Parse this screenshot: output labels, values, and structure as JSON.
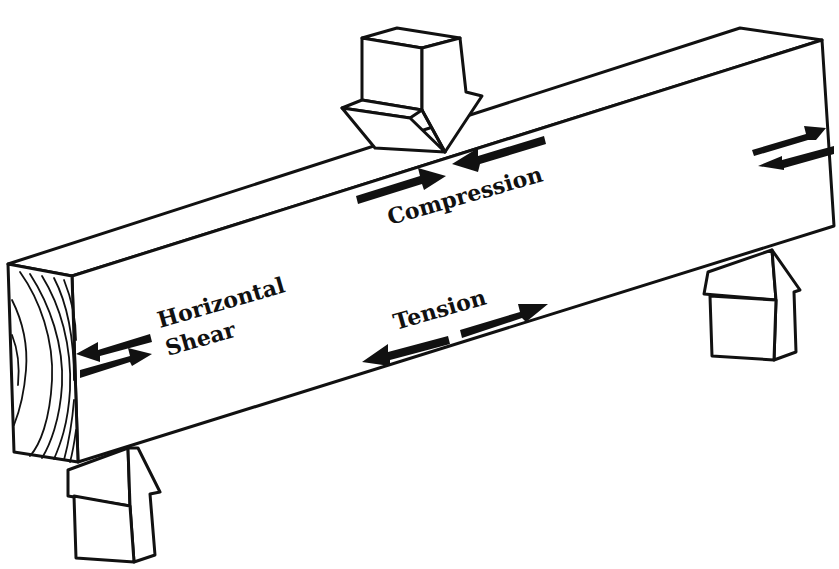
{
  "diagram": {
    "colors": {
      "ink": "#111111",
      "paper": "#ffffff"
    },
    "labels": {
      "compression": "Compression",
      "tension": "Tension",
      "horizontal_shear_line1": "Horizontal",
      "horizontal_shear_line2": "Shear"
    },
    "elements": {
      "beam": "Wooden beam (isometric view)",
      "end_grain": "End grain face with growth rings",
      "load_arrow": "Downward load arrow at mid-span",
      "left_support": "Upward reaction arrow (left support)",
      "right_support": "Upward reaction arrow (right support)",
      "compression_arrows": "Opposing arrows pointing inward along top",
      "tension_arrows": "Opposing arrows pointing outward along bottom",
      "shear_arrows_left": "Horizontal shear arrow pair at left end",
      "shear_arrows_right": "Horizontal shear arrow pair at right end"
    }
  }
}
